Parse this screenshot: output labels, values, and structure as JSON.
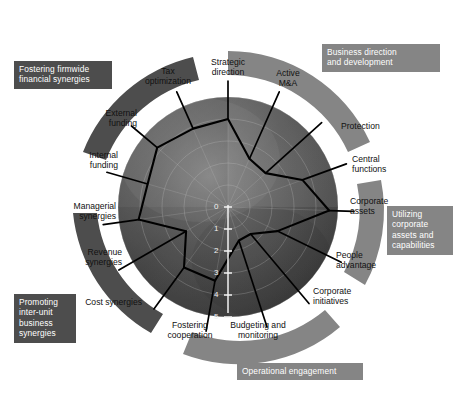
{
  "figure": {
    "background_color": "#ffffff",
    "arc_dark_color": "#4d4d4d",
    "arc_light_color": "#858585",
    "plot_line_color": "#000000",
    "plot_center": {
      "x": 228,
      "y": 207
    },
    "plot_radius": 110
  },
  "arc_groups": [
    {
      "id": "business-direction",
      "label": "Business direction\nand development",
      "line1": "Business direction",
      "line2": "and development",
      "tone": "light",
      "label_left": 322,
      "label_top": 44,
      "label_width": 118,
      "arc_start_deg": -78,
      "arc_end_deg": -8
    },
    {
      "id": "utilizing-corporate-assets",
      "label": "Utilizing corporate assets and capabilities",
      "line1": "Utilizing",
      "line2": "corporate",
      "line3": "assets and",
      "line4": "capabilities",
      "tone": "light",
      "label_left": 387,
      "label_top": 206,
      "label_width": 66,
      "arc_start_deg": 8,
      "arc_end_deg": 76
    },
    {
      "id": "operational-engagement",
      "label": "Operational engagement",
      "line1": "Operational engagement",
      "tone": "light",
      "label_left": 237,
      "label_top": 363,
      "label_width": 126,
      "arc_start_deg": 92,
      "arc_end_deg": 166
    },
    {
      "id": "promoting-inter-unit",
      "label": "Promoting inter-unit business synergies",
      "line1": "Promoting",
      "line2": "inter-unit",
      "line3": "business",
      "line4": "synergies",
      "tone": "dark",
      "label_left": 14,
      "label_top": 294,
      "label_width": 62,
      "arc_start_deg": 104,
      "arc_end_deg": 176
    },
    {
      "id": "fostering-firmwide",
      "label": "Fostering firmwide financial synergies",
      "line1": "Fostering firmwide",
      "line2": "financial synergies",
      "tone": "dark",
      "label_left": 14,
      "label_top": 61,
      "label_width": 98,
      "arc_start_deg": 188,
      "arc_end_deg": 262
    }
  ],
  "scale": {
    "ticks": [
      "0",
      "1",
      "2",
      "3",
      "4",
      "5"
    ],
    "min": 0,
    "max": 5,
    "direction": "downward-from-center",
    "axis_color": "#f2f2f2"
  },
  "chart_data": {
    "type": "radar",
    "subtitle": "",
    "xlabel": "",
    "ylabel": "",
    "rlim": [
      0,
      5
    ],
    "r_inverted": true,
    "grid": true,
    "legend_position": "none",
    "tick_labels": [
      "0",
      "1",
      "2",
      "3",
      "4",
      "5"
    ],
    "categories": [
      "Strategic direction",
      "Active M&A",
      "Protection",
      "Central functions",
      "Corporate assets",
      "People advantage",
      "Corporate initiatives",
      "Budgeting and monitoring",
      "Fostering cooperation",
      "Cost synergies",
      "Revenue synergies",
      "Managerial synergies",
      "Internal funding",
      "External funding",
      "Tax optimization"
    ],
    "series": [
      {
        "name": "Capability profile",
        "values": [
          4.0,
          2.4,
          2.3,
          3.6,
          4.6,
          2.5,
          1.6,
          1.6,
          3.4,
          3.4,
          2.2,
          4.1,
          3.8,
          4.2,
          3.9
        ]
      }
    ]
  },
  "spokes": [
    {
      "id": "strategic-direction",
      "line1": "Strategic",
      "line2": "direction",
      "angle_deg": -90,
      "value": 4.0,
      "label_x": 228,
      "label_y": 68,
      "align": "c",
      "leader": true
    },
    {
      "id": "active-ma",
      "line1": "Active",
      "line2": "M&A",
      "angle_deg": -66,
      "value": 2.4,
      "label_x": 288,
      "label_y": 79,
      "align": "c",
      "leader": true
    },
    {
      "id": "protection",
      "line1": "Protection",
      "line2": "",
      "angle_deg": -42,
      "value": 2.3,
      "label_x": 341,
      "label_y": 127,
      "align": "l",
      "leader": true
    },
    {
      "id": "central-functions",
      "line1": "Central",
      "line2": "functions",
      "angle_deg": -20,
      "value": 3.6,
      "label_x": 352,
      "label_y": 165,
      "align": "l",
      "leader": true
    },
    {
      "id": "corporate-assets",
      "line1": "Corporate",
      "line2": "assets",
      "angle_deg": 2,
      "value": 4.6,
      "label_x": 350,
      "label_y": 207,
      "align": "l",
      "leader": true
    },
    {
      "id": "people-advantage",
      "line1": "People",
      "line2": "advantage",
      "angle_deg": 26,
      "value": 2.5,
      "label_x": 336,
      "label_y": 261,
      "align": "l",
      "leader": true
    },
    {
      "id": "corporate-initiatives",
      "line1": "Corporate",
      "line2": "initiatives",
      "angle_deg": 50,
      "value": 1.6,
      "label_x": 313,
      "label_y": 297,
      "align": "l",
      "leader": true
    },
    {
      "id": "budgeting-and-monitoring",
      "line1": "Budgeting and",
      "line2": "monitoring",
      "angle_deg": 72,
      "value": 1.6,
      "label_x": 258,
      "label_y": 331,
      "align": "c",
      "leader": true
    },
    {
      "id": "fostering-cooperation",
      "line1": "Fostering",
      "line2": "cooperation",
      "angle_deg": 100,
      "value": 3.4,
      "label_x": 190,
      "label_y": 331,
      "align": "c",
      "leader": true
    },
    {
      "id": "cost-synergies",
      "line1": "Cost synergies",
      "line2": "",
      "angle_deg": 126,
      "value": 3.4,
      "label_x": 142,
      "label_y": 303,
      "align": "r",
      "leader": true
    },
    {
      "id": "revenue-synergies",
      "line1": "Revenue",
      "line2": "synergies",
      "angle_deg": 150,
      "value": 2.2,
      "label_x": 122,
      "label_y": 258,
      "align": "r",
      "leader": true
    },
    {
      "id": "managerial-synergies",
      "line1": "Managerial",
      "line2": "synergies",
      "angle_deg": 172,
      "value": 4.1,
      "label_x": 116,
      "label_y": 212,
      "align": "r",
      "leader": true
    },
    {
      "id": "internal-funding",
      "line1": "Internal",
      "line2": "funding",
      "angle_deg": -164,
      "value": 3.8,
      "label_x": 118,
      "label_y": 161,
      "align": "r",
      "leader": true
    },
    {
      "id": "external-funding",
      "line1": "External",
      "line2": "funding",
      "angle_deg": -140,
      "value": 4.2,
      "label_x": 137,
      "label_y": 119,
      "align": "r",
      "leader": true
    },
    {
      "id": "tax-optimization",
      "line1": "Tax",
      "line2": "optimization",
      "angle_deg": -114,
      "value": 3.9,
      "label_x": 168,
      "label_y": 77,
      "align": "c",
      "leader": true
    }
  ]
}
